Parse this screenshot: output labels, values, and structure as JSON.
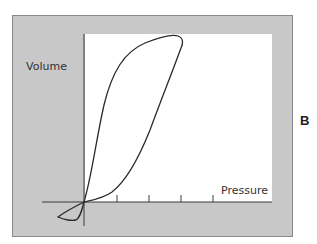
{
  "figure": {
    "panel_letter": "B",
    "y_axis_label": "Volume",
    "x_axis_label": "Pressure",
    "tick_count": 4,
    "curve_description": "Pressure-volume loop (hysteresis loop) with small negative-pressure loop near origin",
    "colors": {
      "frame_background": "#c8c8c8",
      "plot_background": "#ffffff",
      "line": "#2a2a2a"
    }
  }
}
